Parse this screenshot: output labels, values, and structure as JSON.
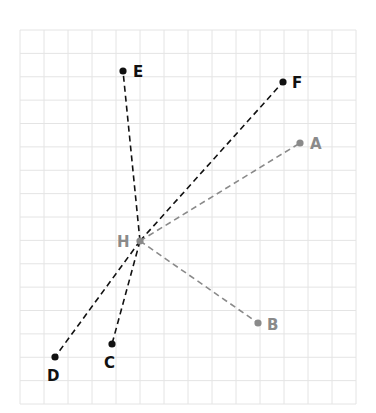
{
  "diagram": {
    "grid": {
      "x0": 20,
      "y0": 30,
      "x1": 356,
      "y1": 404,
      "cols": 14,
      "rows": 16,
      "line_color": "#e4e4e4"
    },
    "colors": {
      "dark": "#111111",
      "gray": "#8a8a8a"
    },
    "center": "H",
    "points": [
      {
        "id": "A",
        "label": "A",
        "x": 300,
        "y": 143,
        "tone": "gray",
        "lx": 310,
        "ly": 149
      },
      {
        "id": "B",
        "label": "B",
        "x": 258,
        "y": 323,
        "tone": "gray",
        "lx": 267,
        "ly": 330
      },
      {
        "id": "C",
        "label": "C",
        "x": 112,
        "y": 344,
        "tone": "dark",
        "lx": 104,
        "ly": 368
      },
      {
        "id": "D",
        "label": "D",
        "x": 55,
        "y": 357,
        "tone": "dark",
        "lx": 47,
        "ly": 381
      },
      {
        "id": "E",
        "label": "E",
        "x": 123,
        "y": 71,
        "tone": "dark",
        "lx": 133,
        "ly": 77
      },
      {
        "id": "F",
        "label": "F",
        "x": 283,
        "y": 82,
        "tone": "dark",
        "lx": 292,
        "ly": 88
      },
      {
        "id": "H",
        "label": "H",
        "x": 140,
        "y": 241,
        "tone": "gray",
        "lx": 117,
        "ly": 247
      }
    ],
    "segments": [
      {
        "from": "H",
        "to": "E",
        "tone": "dark"
      },
      {
        "from": "H",
        "to": "F",
        "tone": "dark"
      },
      {
        "from": "H",
        "to": "C",
        "tone": "dark"
      },
      {
        "from": "H",
        "to": "D",
        "tone": "dark"
      },
      {
        "from": "H",
        "to": "A",
        "tone": "gray"
      },
      {
        "from": "H",
        "to": "B",
        "tone": "gray"
      }
    ]
  }
}
